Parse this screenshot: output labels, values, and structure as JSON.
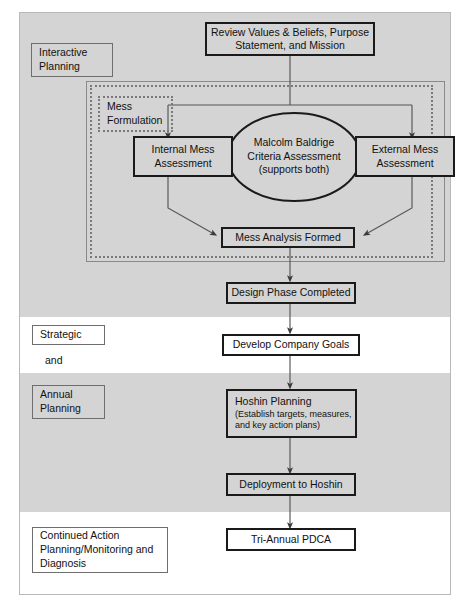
{
  "diagram": {
    "bands": [
      {
        "name": "interactive-planning-band",
        "fill": "#d4d4d4",
        "top": 13,
        "height": 304
      },
      {
        "name": "strategic-and-band",
        "fill": "#ffffff",
        "top": 317,
        "height": 56
      },
      {
        "name": "annual-planning-band",
        "fill": "#d4d4d4",
        "top": 373,
        "height": 139
      },
      {
        "name": "continued-action-band",
        "fill": "#ffffff",
        "top": 512,
        "height": 82
      }
    ],
    "phase_labels": [
      {
        "id": "interactive-planning",
        "lines": [
          "Interactive",
          "Planning"
        ]
      },
      {
        "id": "strategic",
        "lines": [
          "Strategic"
        ]
      },
      {
        "id": "and",
        "lines": [
          "and"
        ]
      },
      {
        "id": "annual-planning",
        "lines": [
          "Annual",
          "Planning"
        ]
      },
      {
        "id": "continued-action",
        "lines": [
          "Continued Action",
          "Planning/Monitoring and",
          "Diagnosis"
        ]
      }
    ],
    "group_label": {
      "id": "mess-formulation",
      "lines": [
        "Mess",
        "Formulation"
      ]
    },
    "nodes": [
      {
        "id": "review-values",
        "lines": [
          "Review Values & Beliefs, Purpose",
          "Statement, and Mission"
        ]
      },
      {
        "id": "internal-mess-assessment",
        "lines": [
          "Internal Mess",
          "Assessment"
        ]
      },
      {
        "id": "external-mess-assessment",
        "lines": [
          "External Mess",
          "Assessment"
        ]
      },
      {
        "id": "malcolm-baldrige",
        "lines": [
          "Malcolm Baldrige",
          "Criteria Assessment",
          "(supports both)"
        ]
      },
      {
        "id": "mess-analysis-formed",
        "lines": [
          "Mess Analysis Formed"
        ]
      },
      {
        "id": "design-phase-completed",
        "lines": [
          "Design Phase Completed"
        ]
      },
      {
        "id": "develop-company-goals",
        "lines": [
          "Develop Company Goals"
        ]
      },
      {
        "id": "hoshin-planning",
        "title": "Hoshin Planning",
        "detail": [
          "(Establish targets, measures,",
          "and key action plans)"
        ]
      },
      {
        "id": "deployment-to-hoshin",
        "lines": [
          "Deployment to Hoshin"
        ]
      },
      {
        "id": "tri-annual-pdca",
        "lines": [
          "Tri-Annual PDCA"
        ]
      }
    ],
    "colors": {
      "band_gray": "#d4d4d4",
      "band_white": "#ffffff",
      "box_border": "#1a1a1a",
      "label_border": "#6e6e6e",
      "dashed_border": "#7a7a7a",
      "connector": "#555555",
      "text": "#111111"
    }
  }
}
